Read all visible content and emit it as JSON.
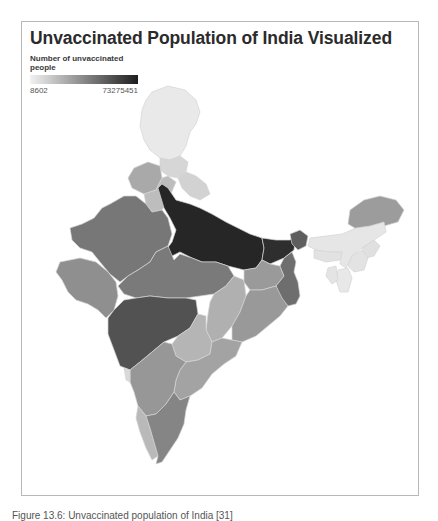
{
  "title": "Unvaccinated Population of India Visualized",
  "legend": {
    "title": "Number of unvaccinated people",
    "min_label": "8602",
    "max_label": "73275451",
    "min_color": "#f2f2f2",
    "max_color": "#1e1e1e"
  },
  "caption": "Figure 13.6: Unvaccinated population of India [31]",
  "map_data": {
    "type": "choropleth",
    "region": "India",
    "metric": "Number of unvaccinated people",
    "scale": {
      "min": 8602,
      "max": 73275451,
      "palette": "grayscale light-to-dark"
    },
    "regions": [
      {
        "name": "Jammu and Kashmir",
        "shade": "very light",
        "color": "#e9e9e9"
      },
      {
        "name": "Himachal Pradesh",
        "shade": "light",
        "color": "#d6d6d6"
      },
      {
        "name": "Punjab",
        "shade": "medium-light",
        "color": "#a9a9a9"
      },
      {
        "name": "Uttarakhand",
        "shade": "light",
        "color": "#d2d2d2"
      },
      {
        "name": "Haryana",
        "shade": "light",
        "color": "#bdbdbd"
      },
      {
        "name": "Uttar Pradesh",
        "shade": "darkest",
        "color": "#262626"
      },
      {
        "name": "Bihar",
        "shade": "very dark",
        "color": "#2e2e2e"
      },
      {
        "name": "Rajasthan",
        "shade": "medium-dark",
        "color": "#777777"
      },
      {
        "name": "Gujarat",
        "shade": "medium",
        "color": "#8f8f8f"
      },
      {
        "name": "Madhya Pradesh",
        "shade": "medium-dark",
        "color": "#7a7a7a"
      },
      {
        "name": "Maharashtra",
        "shade": "dark",
        "color": "#525252"
      },
      {
        "name": "Chhattisgarh",
        "shade": "medium-light",
        "color": "#b0b0b0"
      },
      {
        "name": "Jharkhand",
        "shade": "medium",
        "color": "#9a9a9a"
      },
      {
        "name": "West Bengal",
        "shade": "medium-dark",
        "color": "#6e6e6e"
      },
      {
        "name": "Odisha",
        "shade": "medium",
        "color": "#999999"
      },
      {
        "name": "Telangana",
        "shade": "light",
        "color": "#b5b5b5"
      },
      {
        "name": "Andhra Pradesh",
        "shade": "medium-light",
        "color": "#a3a3a3"
      },
      {
        "name": "Karnataka",
        "shade": "medium",
        "color": "#979797"
      },
      {
        "name": "Goa",
        "shade": "very light",
        "color": "#d9d9d9"
      },
      {
        "name": "Kerala",
        "shade": "light",
        "color": "#b9b9b9"
      },
      {
        "name": "Tamil Nadu",
        "shade": "medium-dark",
        "color": "#858585"
      },
      {
        "name": "Sikkim",
        "shade": "dark",
        "color": "#5e5e5e"
      },
      {
        "name": "Assam",
        "shade": "medium",
        "color": "#9c9c9c"
      },
      {
        "name": "Arunachal Pradesh",
        "shade": "very light",
        "color": "#e6e6e6"
      },
      {
        "name": "Meghalaya",
        "shade": "very light",
        "color": "#e2e2e2"
      },
      {
        "name": "Nagaland",
        "shade": "very light",
        "color": "#e0e0e0"
      },
      {
        "name": "Manipur",
        "shade": "very light",
        "color": "#e3e3e3"
      },
      {
        "name": "Mizoram",
        "shade": "very light",
        "color": "#e8e8e8"
      },
      {
        "name": "Tripura",
        "shade": "very light",
        "color": "#e4e4e4"
      }
    ]
  }
}
